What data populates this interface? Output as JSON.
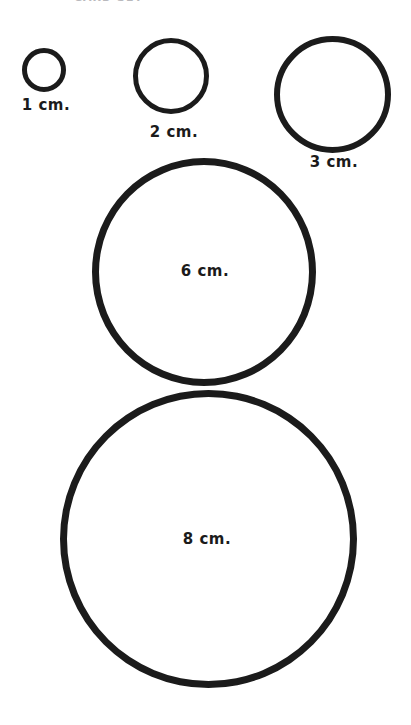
{
  "page": {
    "background_color": "#ffffff",
    "ink_color": "#1b1b1b",
    "clipped_header_text": "CARD SET"
  },
  "chart_data": {
    "type": "scatter",
    "xlabel": "",
    "ylabel": "",
    "units": "cm",
    "categories": [
      "1 cm.",
      "2 cm.",
      "3 cm.",
      "6 cm.",
      "8 cm."
    ],
    "values": [
      1,
      2,
      3,
      6,
      8
    ],
    "series": [
      {
        "name": "circle diameter (cm)",
        "values": [
          1,
          2,
          3,
          6,
          8
        ]
      }
    ],
    "circles": [
      {
        "id": "circle-1cm",
        "label": "1 cm.",
        "diameter_cm": 1,
        "label_position": "below",
        "px_diameter": 44,
        "stroke_px": 5
      },
      {
        "id": "circle-2cm",
        "label": "2 cm.",
        "diameter_cm": 2,
        "label_position": "below",
        "px_diameter": 76,
        "stroke_px": 5
      },
      {
        "id": "circle-3cm",
        "label": "3 cm.",
        "diameter_cm": 3,
        "label_position": "below",
        "px_diameter": 117,
        "stroke_px": 6
      },
      {
        "id": "circle-6cm",
        "label": "6 cm.",
        "diameter_cm": 6,
        "label_position": "inside",
        "px_diameter": 224,
        "stroke_px": 7
      },
      {
        "id": "circle-8cm",
        "label": "8 cm.",
        "diameter_cm": 8,
        "label_position": "inside",
        "px_diameter": 297,
        "stroke_px": 7
      }
    ],
    "grid": false,
    "legend": false
  }
}
